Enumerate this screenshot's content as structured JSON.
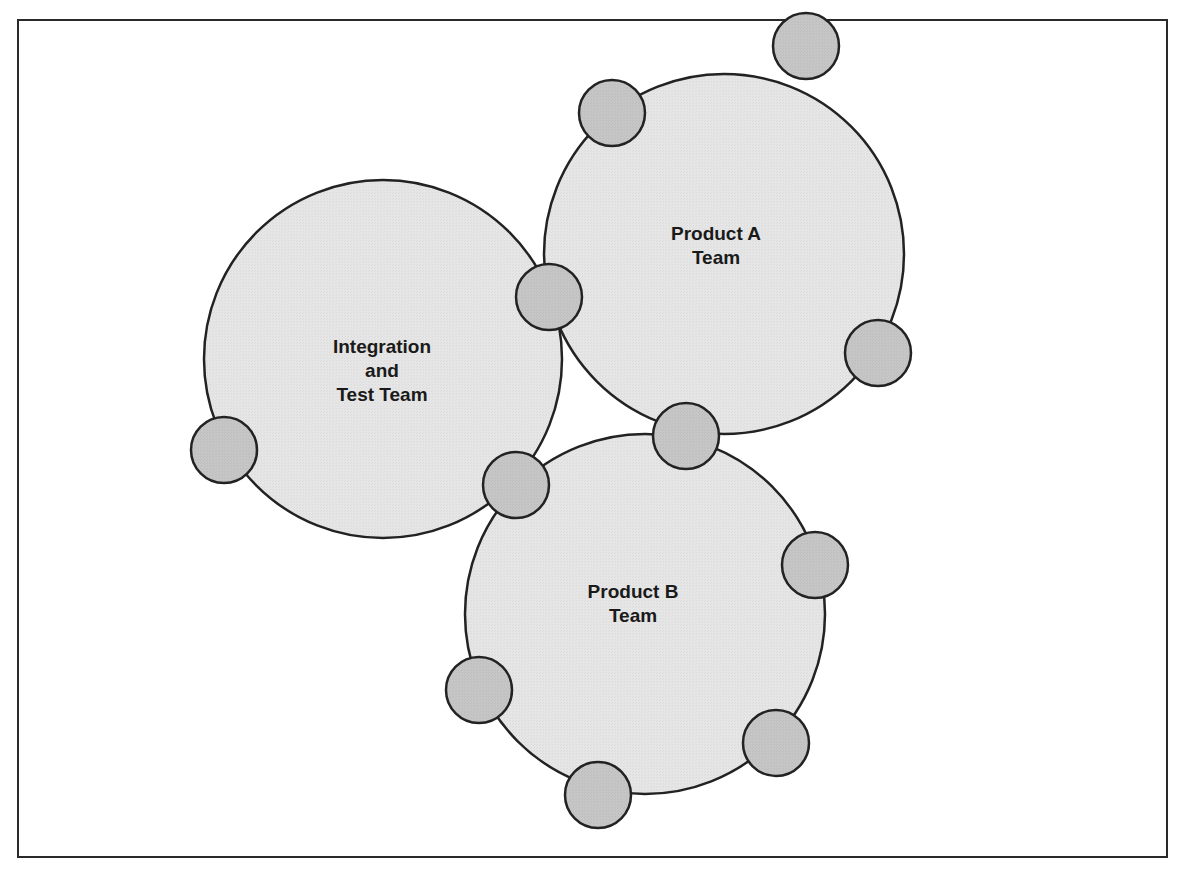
{
  "diagram": {
    "type": "team-circles",
    "colors": {
      "team_fill": "#e6e6e6",
      "member_fill": "#c6c6c6",
      "stroke": "#222222",
      "frame": "#2a2a2a"
    },
    "teams": [
      {
        "id": "integration-test-team",
        "label_lines": [
          "Integration",
          "and",
          "Test Team"
        ],
        "cx": 383,
        "cy": 359,
        "r": 179,
        "label_x": 382,
        "label_y": 371
      },
      {
        "id": "product-a-team",
        "label_lines": [
          "Product A",
          "Team"
        ],
        "cx": 724,
        "cy": 254,
        "r": 180,
        "label_x": 716,
        "label_y": 246
      },
      {
        "id": "product-b-team",
        "label_lines": [
          "Product B",
          "Team"
        ],
        "cx": 645,
        "cy": 614,
        "r": 180,
        "label_x": 633,
        "label_y": 604
      }
    ],
    "members": [
      {
        "cx": 612,
        "cy": 113,
        "r": 33
      },
      {
        "cx": 806,
        "cy": 46,
        "r": 33
      },
      {
        "cx": 878,
        "cy": 353,
        "r": 33
      },
      {
        "cx": 549,
        "cy": 297,
        "r": 33
      },
      {
        "cx": 224,
        "cy": 450,
        "r": 33
      },
      {
        "cx": 516,
        "cy": 485,
        "r": 33
      },
      {
        "cx": 686,
        "cy": 436,
        "r": 33
      },
      {
        "cx": 815,
        "cy": 565,
        "r": 33
      },
      {
        "cx": 479,
        "cy": 690,
        "r": 33
      },
      {
        "cx": 776,
        "cy": 743,
        "r": 33
      },
      {
        "cx": 598,
        "cy": 795,
        "r": 33
      }
    ]
  }
}
